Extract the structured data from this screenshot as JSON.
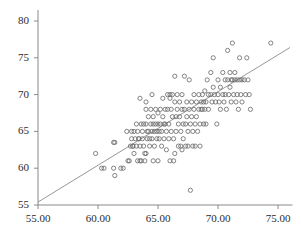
{
  "chart_data": {
    "type": "scatter",
    "title": "",
    "subtitle": "",
    "xlabel": "",
    "ylabel": "",
    "xlim": [
      53.8,
      76.2
    ],
    "ylim": [
      53.5,
      81.5
    ],
    "grid": false,
    "legend": "none",
    "xticks": [
      55,
      60,
      65,
      70,
      75
    ],
    "xtick_labels": [
      "55.00",
      "60.00",
      "65.00",
      "70.00",
      "75.00"
    ],
    "yticks": [
      55,
      60,
      65,
      70,
      75,
      80
    ],
    "ytick_labels": [
      "55",
      "60",
      "65",
      "70",
      "75",
      "80"
    ],
    "marker": "open-circle",
    "marker_color": "#6e6e6e",
    "marker_size": 4.2,
    "axis_color": "#8a8a8a",
    "line_color": "#8a8a8a",
    "reference_line": {
      "type": "linear-fit",
      "x0": 54.0,
      "y0": 54.4,
      "x1": 76.0,
      "y1": 76.4
    },
    "points": [
      [
        59.8,
        62.0
      ],
      [
        60.3,
        60.0
      ],
      [
        60.5,
        60.0
      ],
      [
        61.3,
        63.5
      ],
      [
        61.4,
        63.5
      ],
      [
        61.3,
        60.0
      ],
      [
        61.4,
        59.0
      ],
      [
        61.9,
        60.0
      ],
      [
        62.1,
        60.0
      ],
      [
        62.5,
        61.0
      ],
      [
        62.6,
        61.0
      ],
      [
        62.8,
        65.0
      ],
      [
        62.8,
        64.0
      ],
      [
        62.9,
        63.0
      ],
      [
        62.9,
        63.0
      ],
      [
        63.0,
        62.0
      ],
      [
        63.0,
        65.0
      ],
      [
        63.1,
        64.0
      ],
      [
        63.2,
        63.0
      ],
      [
        63.2,
        66.0
      ],
      [
        63.3,
        65.0
      ],
      [
        63.4,
        64.0
      ],
      [
        63.4,
        64.0
      ],
      [
        63.5,
        63.0
      ],
      [
        63.5,
        61.0
      ],
      [
        63.6,
        61.0
      ],
      [
        63.6,
        66.0
      ],
      [
        63.7,
        65.0
      ],
      [
        63.7,
        64.0
      ],
      [
        63.8,
        66.0
      ],
      [
        63.8,
        63.0
      ],
      [
        63.9,
        62.0
      ],
      [
        63.9,
        61.0
      ],
      [
        64.0,
        68.0
      ],
      [
        64.0,
        66.0
      ],
      [
        64.1,
        65.0
      ],
      [
        64.1,
        64.0
      ],
      [
        64.2,
        67.0
      ],
      [
        64.2,
        65.0
      ],
      [
        64.3,
        64.0
      ],
      [
        64.3,
        63.0
      ],
      [
        64.4,
        68.0
      ],
      [
        64.4,
        66.0
      ],
      [
        64.5,
        65.0
      ],
      [
        64.5,
        64.0
      ],
      [
        64.6,
        67.0
      ],
      [
        64.6,
        66.0
      ],
      [
        64.7,
        65.0
      ],
      [
        64.7,
        63.0
      ],
      [
        64.8,
        68.0
      ],
      [
        64.8,
        66.0
      ],
      [
        64.9,
        65.0
      ],
      [
        64.9,
        64.0
      ],
      [
        65.0,
        67.5
      ],
      [
        65.0,
        66.0
      ],
      [
        65.1,
        65.0
      ],
      [
        65.1,
        64.0
      ],
      [
        65.2,
        68.0
      ],
      [
        65.2,
        66.0
      ],
      [
        65.3,
        65.0
      ],
      [
        65.3,
        63.0
      ],
      [
        65.4,
        69.5
      ],
      [
        65.4,
        67.0
      ],
      [
        65.5,
        66.0
      ],
      [
        65.5,
        64.0
      ],
      [
        65.6,
        68.0
      ],
      [
        65.6,
        66.0
      ],
      [
        65.7,
        65.0
      ],
      [
        65.7,
        62.5
      ],
      [
        65.8,
        70.0
      ],
      [
        65.8,
        68.0
      ],
      [
        65.9,
        66.0
      ],
      [
        65.9,
        64.0
      ],
      [
        63.5,
        69.5
      ],
      [
        64.0,
        69.0
      ],
      [
        64.5,
        70.0
      ],
      [
        66.0,
        70.0
      ],
      [
        66.0,
        69.5
      ],
      [
        66.1,
        68.0
      ],
      [
        66.1,
        65.0
      ],
      [
        66.2,
        70.0
      ],
      [
        66.2,
        67.0
      ],
      [
        66.3,
        64.0
      ],
      [
        66.3,
        61.0
      ],
      [
        66.4,
        72.5
      ],
      [
        66.4,
        69.0
      ],
      [
        66.5,
        67.0
      ],
      [
        66.5,
        65.0
      ],
      [
        66.6,
        70.0
      ],
      [
        66.6,
        68.0
      ],
      [
        66.7,
        66.0
      ],
      [
        66.7,
        63.0
      ],
      [
        66.8,
        69.0
      ],
      [
        66.8,
        67.0
      ],
      [
        66.9,
        65.0
      ],
      [
        66.9,
        63.0
      ],
      [
        67.0,
        70.0
      ],
      [
        67.0,
        68.0
      ],
      [
        67.1,
        66.0
      ],
      [
        67.1,
        64.0
      ],
      [
        67.2,
        72.5
      ],
      [
        67.2,
        68.0
      ],
      [
        67.3,
        66.0
      ],
      [
        67.3,
        63.0
      ],
      [
        67.4,
        69.0
      ],
      [
        67.4,
        67.0
      ],
      [
        67.5,
        65.0
      ],
      [
        67.5,
        63.0
      ],
      [
        67.7,
        57.0
      ],
      [
        67.6,
        72.0
      ],
      [
        67.6,
        68.0
      ],
      [
        67.7,
        66.0
      ],
      [
        67.8,
        69.0
      ],
      [
        67.8,
        67.0
      ],
      [
        67.9,
        65.0
      ],
      [
        67.9,
        63.0
      ],
      [
        68.0,
        70.0
      ],
      [
        68.0,
        68.0
      ],
      [
        68.1,
        66.0
      ],
      [
        68.1,
        63.0
      ],
      [
        68.2,
        69.0
      ],
      [
        68.2,
        67.0
      ],
      [
        68.3,
        65.0
      ],
      [
        68.4,
        70.0
      ],
      [
        68.4,
        68.0
      ],
      [
        68.5,
        66.0
      ],
      [
        68.5,
        63.0
      ],
      [
        68.6,
        69.0
      ],
      [
        68.6,
        68.0
      ],
      [
        68.7,
        70.0
      ],
      [
        68.7,
        68.0
      ],
      [
        68.8,
        69.0
      ],
      [
        68.8,
        66.0
      ],
      [
        68.9,
        70.5
      ],
      [
        68.9,
        68.0
      ],
      [
        69.0,
        69.0
      ],
      [
        69.0,
        66.0
      ],
      [
        69.1,
        72.0
      ],
      [
        69.2,
        70.0
      ],
      [
        69.2,
        68.0
      ],
      [
        69.4,
        73.0
      ],
      [
        69.4,
        70.0
      ],
      [
        69.5,
        69.0
      ],
      [
        69.6,
        75.0
      ],
      [
        69.6,
        71.0
      ],
      [
        69.7,
        70.0
      ],
      [
        69.8,
        69.0
      ],
      [
        69.9,
        66.0
      ],
      [
        70.0,
        72.0
      ],
      [
        70.0,
        70.0
      ],
      [
        70.1,
        69.0
      ],
      [
        70.2,
        71.0
      ],
      [
        70.2,
        68.0
      ],
      [
        70.4,
        73.0
      ],
      [
        70.4,
        70.0
      ],
      [
        70.5,
        69.0
      ],
      [
        70.6,
        72.0
      ],
      [
        70.6,
        70.0
      ],
      [
        70.7,
        68.0
      ],
      [
        70.8,
        76.0
      ],
      [
        70.8,
        72.0
      ],
      [
        70.9,
        70.0
      ],
      [
        71.0,
        73.0
      ],
      [
        71.0,
        71.0
      ],
      [
        71.1,
        72.0
      ],
      [
        71.1,
        69.0
      ],
      [
        71.2,
        77.0
      ],
      [
        71.2,
        72.0
      ],
      [
        71.3,
        70.0
      ],
      [
        71.4,
        73.0
      ],
      [
        71.4,
        72.0
      ],
      [
        71.5,
        69.0
      ],
      [
        71.6,
        72.0
      ],
      [
        71.6,
        70.0
      ],
      [
        71.7,
        68.0
      ],
      [
        71.8,
        75.0
      ],
      [
        71.8,
        72.0
      ],
      [
        71.9,
        70.0
      ],
      [
        72.0,
        72.0
      ],
      [
        72.0,
        69.0
      ],
      [
        72.2,
        72.0
      ],
      [
        72.3,
        70.0
      ],
      [
        72.4,
        75.0
      ],
      [
        72.5,
        72.0
      ],
      [
        72.6,
        70.0
      ],
      [
        72.7,
        68.0
      ],
      [
        74.4,
        77.0
      ],
      [
        62.7,
        63.0
      ],
      [
        62.4,
        65.0
      ],
      [
        65.0,
        61.0
      ],
      [
        64.6,
        61.0
      ],
      [
        63.3,
        61.0
      ],
      [
        66.0,
        61.0
      ],
      [
        66.4,
        62.0
      ],
      [
        64.0,
        62.0
      ],
      [
        67.0,
        62.5
      ]
    ]
  }
}
